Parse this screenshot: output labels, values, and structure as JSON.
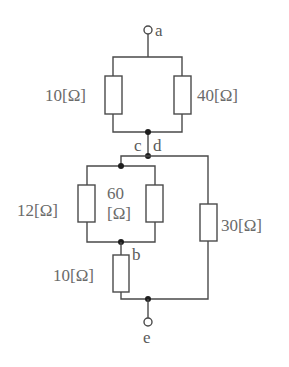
{
  "diagram": {
    "type": "circuit-schematic",
    "terminals": [
      {
        "id": "a",
        "label": "a"
      },
      {
        "id": "e",
        "label": "e"
      }
    ],
    "nodes": [
      {
        "id": "c",
        "label": "c"
      },
      {
        "id": "d",
        "label": "d"
      },
      {
        "id": "b",
        "label": "b"
      }
    ],
    "resistors": [
      {
        "id": "r1",
        "value": "10",
        "unit": "[Ω]",
        "label": "10[Ω]",
        "position": "top-left (a–c)"
      },
      {
        "id": "r2",
        "value": "40",
        "unit": "[Ω]",
        "label": "40[Ω]",
        "position": "top-right (a–c)"
      },
      {
        "id": "r3",
        "value": "12",
        "unit": "[Ω]",
        "label": "12[Ω]",
        "position": "middle-left (d–b)"
      },
      {
        "id": "r4",
        "value": "60",
        "unit": "[Ω]",
        "label_line1": "60",
        "label_line2": "[Ω]",
        "position": "middle-right (d–b)"
      },
      {
        "id": "r5",
        "value": "10",
        "unit": "[Ω]",
        "label": "10[Ω]",
        "position": "lower (b–e)"
      },
      {
        "id": "r6",
        "value": "30",
        "unit": "[Ω]",
        "label": "30[Ω]",
        "position": "right (d–e)"
      }
    ]
  }
}
